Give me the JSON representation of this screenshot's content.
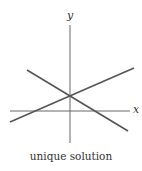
{
  "diagram": {
    "axes": {
      "x_label": "x",
      "y_label": "y"
    },
    "lines": [
      {
        "name": "line-a",
        "x1": 10,
        "y1": 122,
        "x2": 134,
        "y2": 68
      },
      {
        "name": "line-b",
        "x1": 27,
        "y1": 70,
        "x2": 128,
        "y2": 131
      }
    ],
    "intersection": {
      "x": 70,
      "y": 96
    },
    "caption": "unique solution",
    "colors": {
      "line": "#555555",
      "axis": "#666666"
    }
  }
}
